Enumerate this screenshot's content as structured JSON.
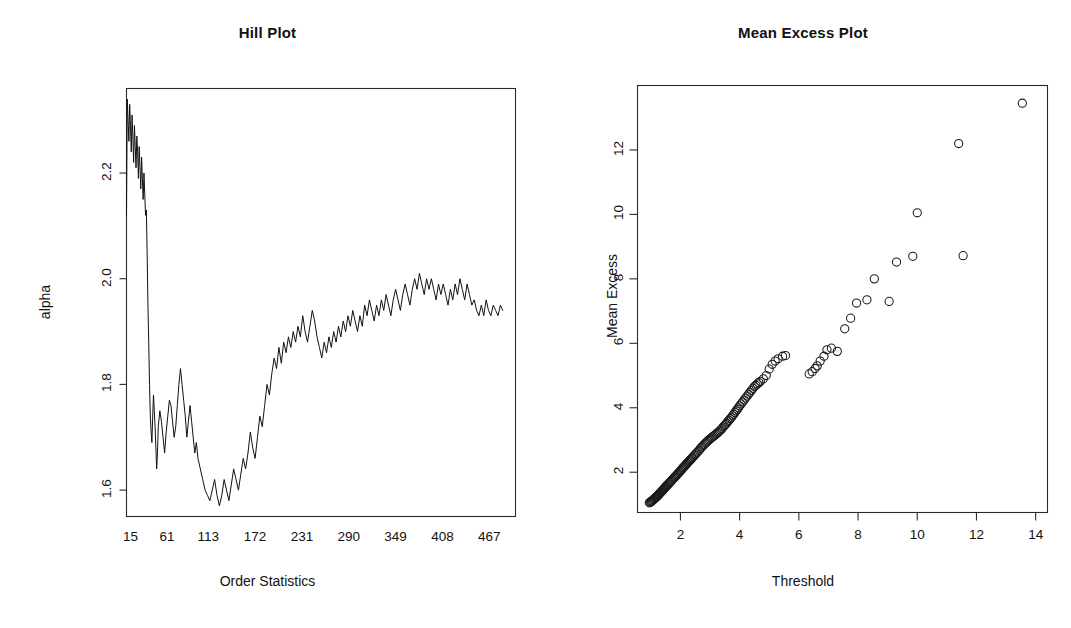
{
  "figure": {
    "width": 1071,
    "height": 628,
    "background": "#ffffff",
    "ink_color": "#111111"
  },
  "panels": [
    {
      "key": "hill",
      "title": "Hill Plot",
      "xlabel": "Order Statistics",
      "ylabel": "alpha"
    },
    {
      "key": "meanexcess",
      "title": "Mean Excess Plot",
      "xlabel": "Threshold",
      "ylabel": "Mean Excess"
    }
  ],
  "chart_data": [
    {
      "type": "line",
      "title": "Hill Plot",
      "xlabel": "Order Statistics",
      "ylabel": "alpha",
      "xticklabels": [
        "15",
        "61",
        "113",
        "172",
        "231",
        "290",
        "349",
        "408",
        "467"
      ],
      "xtickvalues": [
        15,
        61,
        113,
        172,
        231,
        290,
        349,
        408,
        467
      ],
      "yticklabels": [
        "1.6",
        "1.8",
        "2.0",
        "2.2"
      ],
      "ytickvalues": [
        1.6,
        1.8,
        2.0,
        2.2
      ],
      "xlim": [
        10,
        500
      ],
      "ylim": [
        1.55,
        2.36
      ],
      "grid": false,
      "legend": "none",
      "x": [
        10,
        11,
        12,
        13,
        14,
        15,
        16,
        17,
        18,
        19,
        20,
        21,
        22,
        23,
        24,
        25,
        26,
        27,
        28,
        29,
        30,
        31,
        32,
        33,
        34,
        35,
        36,
        37,
        38,
        39,
        40,
        41,
        42,
        43,
        44,
        45,
        46,
        47,
        48,
        49,
        50,
        52,
        54,
        56,
        58,
        60,
        62,
        64,
        66,
        68,
        70,
        72,
        74,
        76,
        78,
        80,
        82,
        84,
        86,
        88,
        90,
        92,
        94,
        96,
        98,
        100,
        103,
        106,
        109,
        112,
        115,
        118,
        121,
        124,
        127,
        130,
        133,
        136,
        139,
        142,
        145,
        148,
        151,
        154,
        157,
        160,
        163,
        166,
        169,
        172,
        175,
        178,
        181,
        184,
        187,
        190,
        193,
        196,
        199,
        202,
        205,
        208,
        211,
        214,
        217,
        220,
        223,
        226,
        229,
        232,
        235,
        238,
        241,
        244,
        247,
        250,
        253,
        256,
        259,
        262,
        265,
        268,
        271,
        274,
        277,
        280,
        283,
        286,
        289,
        292,
        295,
        298,
        301,
        304,
        307,
        310,
        313,
        316,
        319,
        322,
        325,
        328,
        331,
        334,
        337,
        340,
        343,
        346,
        349,
        352,
        355,
        358,
        361,
        364,
        367,
        370,
        373,
        376,
        379,
        382,
        385,
        388,
        391,
        394,
        397,
        400,
        403,
        406,
        409,
        412,
        415,
        418,
        421,
        424,
        427,
        430,
        433,
        436,
        439,
        442,
        445,
        448,
        451,
        454,
        457,
        460,
        463,
        466,
        469,
        472,
        475,
        478,
        481,
        484,
        487,
        490
      ],
      "y": [
        2.12,
        2.34,
        2.3,
        2.26,
        2.33,
        2.29,
        2.24,
        2.31,
        2.27,
        2.22,
        2.29,
        2.25,
        2.21,
        2.27,
        2.24,
        2.19,
        2.25,
        2.21,
        2.17,
        2.23,
        2.19,
        2.15,
        2.2,
        2.16,
        2.12,
        2.13,
        2.05,
        1.95,
        1.88,
        1.8,
        1.74,
        1.71,
        1.69,
        1.74,
        1.78,
        1.75,
        1.72,
        1.68,
        1.64,
        1.67,
        1.72,
        1.75,
        1.73,
        1.7,
        1.67,
        1.71,
        1.74,
        1.77,
        1.76,
        1.73,
        1.7,
        1.72,
        1.76,
        1.8,
        1.83,
        1.8,
        1.77,
        1.74,
        1.7,
        1.73,
        1.76,
        1.73,
        1.7,
        1.67,
        1.69,
        1.66,
        1.64,
        1.62,
        1.6,
        1.59,
        1.58,
        1.6,
        1.62,
        1.59,
        1.57,
        1.59,
        1.62,
        1.6,
        1.58,
        1.61,
        1.64,
        1.62,
        1.6,
        1.63,
        1.66,
        1.64,
        1.67,
        1.71,
        1.68,
        1.66,
        1.7,
        1.74,
        1.72,
        1.76,
        1.8,
        1.78,
        1.82,
        1.85,
        1.83,
        1.87,
        1.84,
        1.88,
        1.86,
        1.89,
        1.87,
        1.9,
        1.88,
        1.91,
        1.89,
        1.93,
        1.9,
        1.88,
        1.91,
        1.94,
        1.92,
        1.89,
        1.87,
        1.85,
        1.88,
        1.86,
        1.89,
        1.87,
        1.9,
        1.88,
        1.91,
        1.89,
        1.92,
        1.9,
        1.93,
        1.91,
        1.94,
        1.92,
        1.9,
        1.93,
        1.91,
        1.95,
        1.93,
        1.96,
        1.94,
        1.92,
        1.95,
        1.93,
        1.96,
        1.94,
        1.97,
        1.95,
        1.93,
        1.96,
        1.98,
        1.96,
        1.94,
        1.97,
        1.99,
        1.97,
        1.95,
        1.98,
        2.0,
        1.98,
        2.01,
        1.99,
        1.97,
        2.0,
        1.98,
        2.0,
        1.98,
        1.96,
        1.99,
        1.97,
        1.99,
        1.97,
        1.95,
        1.98,
        1.96,
        1.99,
        1.97,
        2.0,
        1.98,
        1.96,
        1.99,
        1.97,
        1.95,
        1.96,
        1.94,
        1.93,
        1.95,
        1.93,
        1.96,
        1.94,
        1.93,
        1.95,
        1.94,
        1.93,
        1.95,
        1.94
      ]
    },
    {
      "type": "scatter",
      "title": "Mean Excess Plot",
      "xlabel": "Threshold",
      "ylabel": "Mean Excess",
      "xticklabels": [
        "2",
        "4",
        "6",
        "8",
        "10",
        "12",
        "14"
      ],
      "xtickvalues": [
        2,
        4,
        6,
        8,
        10,
        12,
        14
      ],
      "yticklabels": [
        "2",
        "4",
        "6",
        "8",
        "10",
        "12"
      ],
      "ytickvalues": [
        2,
        4,
        6,
        8,
        10,
        12
      ],
      "xlim": [
        0.55,
        14.4
      ],
      "ylim": [
        0.75,
        14.0
      ],
      "grid": false,
      "legend": "none",
      "marker": "open-circle",
      "points": [
        [
          0.95,
          1.05
        ],
        [
          0.98,
          1.07
        ],
        [
          1.0,
          1.08
        ],
        [
          1.02,
          1.1
        ],
        [
          1.04,
          1.11
        ],
        [
          1.06,
          1.13
        ],
        [
          1.08,
          1.14
        ],
        [
          1.1,
          1.16
        ],
        [
          1.12,
          1.18
        ],
        [
          1.14,
          1.19
        ],
        [
          1.16,
          1.21
        ],
        [
          1.18,
          1.23
        ],
        [
          1.2,
          1.24
        ],
        [
          1.22,
          1.26
        ],
        [
          1.24,
          1.28
        ],
        [
          1.26,
          1.3
        ],
        [
          1.28,
          1.32
        ],
        [
          1.3,
          1.34
        ],
        [
          1.32,
          1.36
        ],
        [
          1.34,
          1.38
        ],
        [
          1.36,
          1.4
        ],
        [
          1.38,
          1.42
        ],
        [
          1.4,
          1.44
        ],
        [
          1.42,
          1.46
        ],
        [
          1.44,
          1.48
        ],
        [
          1.46,
          1.5
        ],
        [
          1.48,
          1.52
        ],
        [
          1.5,
          1.55
        ],
        [
          1.53,
          1.57
        ],
        [
          1.56,
          1.6
        ],
        [
          1.59,
          1.63
        ],
        [
          1.62,
          1.66
        ],
        [
          1.65,
          1.69
        ],
        [
          1.68,
          1.72
        ],
        [
          1.71,
          1.75
        ],
        [
          1.74,
          1.78
        ],
        [
          1.77,
          1.81
        ],
        [
          1.8,
          1.84
        ],
        [
          1.83,
          1.87
        ],
        [
          1.86,
          1.9
        ],
        [
          1.89,
          1.93
        ],
        [
          1.92,
          1.96
        ],
        [
          1.95,
          1.99
        ],
        [
          1.98,
          2.02
        ],
        [
          2.01,
          2.05
        ],
        [
          2.04,
          2.08
        ],
        [
          2.07,
          2.12
        ],
        [
          2.1,
          2.15
        ],
        [
          2.13,
          2.18
        ],
        [
          2.16,
          2.21
        ],
        [
          2.19,
          2.24
        ],
        [
          2.22,
          2.27
        ],
        [
          2.25,
          2.3
        ],
        [
          2.28,
          2.33
        ],
        [
          2.31,
          2.36
        ],
        [
          2.34,
          2.39
        ],
        [
          2.37,
          2.42
        ],
        [
          2.4,
          2.45
        ],
        [
          2.44,
          2.49
        ],
        [
          2.48,
          2.53
        ],
        [
          2.52,
          2.57
        ],
        [
          2.56,
          2.61
        ],
        [
          2.6,
          2.65
        ],
        [
          2.64,
          2.69
        ],
        [
          2.68,
          2.74
        ],
        [
          2.72,
          2.78
        ],
        [
          2.76,
          2.82
        ],
        [
          2.8,
          2.86
        ],
        [
          2.84,
          2.9
        ],
        [
          2.88,
          2.93
        ],
        [
          2.92,
          2.97
        ],
        [
          2.96,
          3.0
        ],
        [
          3.0,
          3.03
        ],
        [
          3.04,
          3.06
        ],
        [
          3.08,
          3.09
        ],
        [
          3.12,
          3.12
        ],
        [
          3.16,
          3.15
        ],
        [
          3.2,
          3.18
        ],
        [
          3.24,
          3.21
        ],
        [
          3.28,
          3.24
        ],
        [
          3.32,
          3.28
        ],
        [
          3.36,
          3.31
        ],
        [
          3.4,
          3.35
        ],
        [
          3.44,
          3.4
        ],
        [
          3.48,
          3.44
        ],
        [
          3.52,
          3.48
        ],
        [
          3.56,
          3.52
        ],
        [
          3.6,
          3.57
        ],
        [
          3.64,
          3.61
        ],
        [
          3.68,
          3.66
        ],
        [
          3.72,
          3.7
        ],
        [
          3.76,
          3.75
        ],
        [
          3.8,
          3.8
        ],
        [
          3.84,
          3.85
        ],
        [
          3.88,
          3.9
        ],
        [
          3.92,
          3.95
        ],
        [
          3.96,
          4.0
        ],
        [
          4.0,
          4.06
        ],
        [
          4.05,
          4.12
        ],
        [
          4.1,
          4.18
        ],
        [
          4.15,
          4.24
        ],
        [
          4.2,
          4.3
        ],
        [
          4.25,
          4.36
        ],
        [
          4.3,
          4.42
        ],
        [
          4.35,
          4.48
        ],
        [
          4.4,
          4.54
        ],
        [
          4.45,
          4.6
        ],
        [
          4.5,
          4.66
        ],
        [
          4.55,
          4.7
        ],
        [
          4.6,
          4.74
        ],
        [
          4.65,
          4.78
        ],
        [
          4.7,
          4.82
        ],
        [
          4.8,
          4.9
        ],
        [
          4.9,
          5.0
        ],
        [
          5.0,
          5.2
        ],
        [
          5.1,
          5.35
        ],
        [
          5.2,
          5.45
        ],
        [
          5.3,
          5.52
        ],
        [
          5.45,
          5.6
        ],
        [
          5.55,
          5.62
        ],
        [
          6.35,
          5.05
        ],
        [
          6.45,
          5.12
        ],
        [
          6.55,
          5.22
        ],
        [
          6.62,
          5.3
        ],
        [
          6.72,
          5.45
        ],
        [
          6.85,
          5.6
        ],
        [
          6.95,
          5.8
        ],
        [
          7.1,
          5.85
        ],
        [
          7.3,
          5.75
        ],
        [
          7.55,
          6.45
        ],
        [
          7.75,
          6.78
        ],
        [
          7.95,
          7.25
        ],
        [
          8.3,
          7.35
        ],
        [
          8.55,
          8.0
        ],
        [
          9.05,
          7.3
        ],
        [
          9.3,
          8.52
        ],
        [
          9.85,
          8.7
        ],
        [
          10.0,
          10.05
        ],
        [
          11.4,
          12.2
        ],
        [
          11.55,
          8.72
        ],
        [
          13.55,
          13.45
        ]
      ]
    }
  ]
}
